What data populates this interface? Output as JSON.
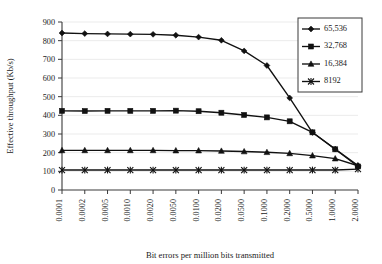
{
  "chart_data": {
    "type": "line",
    "title": "",
    "xlabel": "Bit errors per million bits transmitted",
    "ylabel": "Effective throughput (Kb/s)",
    "categories": [
      "0.0001",
      "0.0002",
      "0.0005",
      "0.0010",
      "0.0020",
      "0.0050",
      "0.0100",
      "0.0200",
      "0.0500",
      "0.1000",
      "0.2000",
      "0.5000",
      "1.0000",
      "2.0000"
    ],
    "ylim": [
      0,
      900
    ],
    "ytick_step": 100,
    "yticks": [
      "0",
      "100",
      "200",
      "300",
      "400",
      "500",
      "600",
      "700",
      "800",
      "900"
    ],
    "grid": "horizontal",
    "legend_position": "top-right",
    "series": [
      {
        "name": "65,536",
        "marker": "diamond",
        "values": [
          841,
          838,
          836,
          835,
          834,
          829,
          819,
          802,
          745,
          667,
          493,
          308,
          219,
          131
        ]
      },
      {
        "name": "32,768",
        "marker": "square",
        "values": [
          424,
          423,
          424,
          424,
          424,
          425,
          422,
          414,
          402,
          389,
          368,
          309,
          218,
          126
        ]
      },
      {
        "name": "16,384",
        "marker": "triangle",
        "values": [
          212,
          212,
          212,
          212,
          212,
          211,
          211,
          209,
          206,
          202,
          196,
          184,
          168,
          130
        ]
      },
      {
        "name": "8192",
        "marker": "star",
        "values": [
          107,
          107,
          107,
          107,
          107,
          107,
          107,
          107,
          107,
          107,
          107,
          107,
          107,
          112
        ]
      }
    ]
  }
}
